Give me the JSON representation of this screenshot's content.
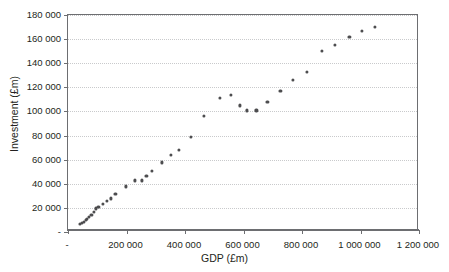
{
  "chart_data": {
    "type": "scatter",
    "title": "",
    "xlabel": "GDP (£m)",
    "ylabel": "Investment (£m)",
    "xlim": [
      0,
      1200000
    ],
    "ylim": [
      0,
      180000
    ],
    "grid": true,
    "legend": null,
    "marker_color": "#4d4d4f",
    "xticks": [
      0,
      200000,
      400000,
      600000,
      800000,
      1000000,
      1200000
    ],
    "xticklabels": [
      "-",
      "200 000",
      "400 000",
      "600 000",
      "800 000",
      "1 000 000",
      "1 200 000"
    ],
    "yticks": [
      0,
      20000,
      40000,
      60000,
      80000,
      100000,
      120000,
      140000,
      160000,
      180000
    ],
    "yticklabels": [
      "-",
      "20 000",
      "40 000",
      "60 000",
      "80 000",
      "100 000",
      "120 000",
      "140 000",
      "160 000",
      "180 000"
    ],
    "points": [
      {
        "x": 42000,
        "y": 6500
      },
      {
        "x": 48000,
        "y": 7500
      },
      {
        "x": 54000,
        "y": 8500
      },
      {
        "x": 60000,
        "y": 9800
      },
      {
        "x": 66000,
        "y": 11000
      },
      {
        "x": 72000,
        "y": 12200
      },
      {
        "x": 80000,
        "y": 14000
      },
      {
        "x": 88000,
        "y": 16500
      },
      {
        "x": 96000,
        "y": 19500
      },
      {
        "x": 104000,
        "y": 20800
      },
      {
        "x": 118000,
        "y": 23000
      },
      {
        "x": 132000,
        "y": 25500
      },
      {
        "x": 146000,
        "y": 27800
      },
      {
        "x": 162000,
        "y": 31500
      },
      {
        "x": 198000,
        "y": 37800
      },
      {
        "x": 228000,
        "y": 42800
      },
      {
        "x": 252000,
        "y": 42800
      },
      {
        "x": 268000,
        "y": 46500
      },
      {
        "x": 288000,
        "y": 50800
      },
      {
        "x": 320000,
        "y": 57800
      },
      {
        "x": 352000,
        "y": 63800
      },
      {
        "x": 380000,
        "y": 67800
      },
      {
        "x": 420000,
        "y": 78800
      },
      {
        "x": 466000,
        "y": 96000
      },
      {
        "x": 518000,
        "y": 111000
      },
      {
        "x": 556000,
        "y": 114000
      },
      {
        "x": 588000,
        "y": 105000
      },
      {
        "x": 612000,
        "y": 100800
      },
      {
        "x": 644000,
        "y": 100800
      },
      {
        "x": 682000,
        "y": 108000
      },
      {
        "x": 726000,
        "y": 117000
      },
      {
        "x": 770000,
        "y": 126000
      },
      {
        "x": 818000,
        "y": 133000
      },
      {
        "x": 868000,
        "y": 150500
      },
      {
        "x": 912000,
        "y": 155000
      },
      {
        "x": 962000,
        "y": 161500
      },
      {
        "x": 1006000,
        "y": 167000
      },
      {
        "x": 1050000,
        "y": 170000
      }
    ]
  }
}
